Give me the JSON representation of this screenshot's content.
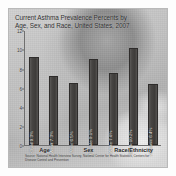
{
  "chart_data": {
    "type": "bar",
    "title": "Current Asthma Prevalence Percents by\nAge, Sex, and Race, United States, 2007",
    "xlabel": "",
    "ylabel": "",
    "ylim": [
      0,
      12
    ],
    "yticks": [
      12,
      10,
      8,
      6,
      4,
      2,
      0
    ],
    "grid": false,
    "legend": "none",
    "categories": [
      "Child",
      "Adult",
      "Male",
      "Female",
      "White",
      "Black",
      "Hispanic"
    ],
    "values": [
      9.3,
      7.3,
      6.5,
      9.1,
      7.6,
      10.2,
      6.4
    ],
    "bar_labels": [
      "Child 9.3%",
      "Adult 7.3%",
      "Male 6.5%",
      "Female 9.1%",
      "White 7.6%",
      "Black 10.2%",
      "Hispanic 6.4%"
    ],
    "groups": [
      {
        "label": "Age",
        "center_pct": 15
      },
      {
        "label": "Sex",
        "center_pct": 47
      },
      {
        "label": "Race/Ethnicity",
        "center_pct": 80
      }
    ],
    "source": "Source: National Health Interview Survey, National Center for Health Statistics, Centers for Disease Control and Prevention",
    "colors": {
      "bar": "#474543",
      "bar_label_text": "#f2f0ee",
      "axis": "#6f6f6f",
      "title_text": "#2b2b2b"
    }
  }
}
